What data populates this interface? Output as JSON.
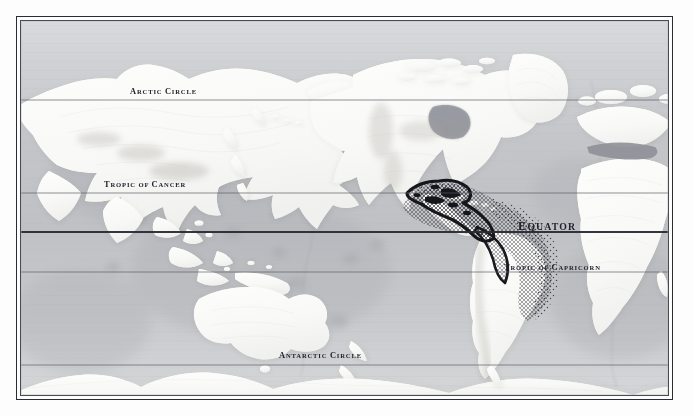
{
  "map": {
    "title_visible": false,
    "projection_center": "Pacific",
    "style": "antique shaded-relief physical world map",
    "frame_color": "#2b2b33",
    "ocean_color": "#c6c7ca",
    "land_color": "#fbfbfa",
    "shelf_color": "#8e9096",
    "range_core_color": "#16161c",
    "range_stipple_color": "#2a2a32",
    "graticule_color": "#5b5b66",
    "equator_color": "#2b2b33",
    "labels": [
      {
        "id": "arctic-circle",
        "text": "Arctic Circle",
        "size": "small",
        "latitude_y": 100
      },
      {
        "id": "tropic-cancer",
        "text": "Tropic of Cancer",
        "size": "small",
        "latitude_y": 193
      },
      {
        "id": "equator",
        "text": "Equator",
        "size": "large",
        "latitude_y": 233
      },
      {
        "id": "tropic-capricorn",
        "text": "Tropic of Capricorn",
        "size": "small",
        "latitude_y": 272
      },
      {
        "id": "antarctic-circle",
        "text": "Antarctic Circle",
        "size": "small",
        "latitude_y": 365
      }
    ],
    "distribution_range": {
      "label_visible": false,
      "core_region": "Central America, Caribbean and Gulf of Mexico",
      "stipple_region": "Eastern tropical Pacific and Pacific coast of South America"
    }
  },
  "chart_data": {
    "type": "map",
    "title": "",
    "xlabel": "",
    "ylabel": "",
    "latitude_lines": [
      {
        "name": "Arctic Circle",
        "value": 66.5,
        "hemisphere": "N",
        "weight": "thin"
      },
      {
        "name": "Tropic of Cancer",
        "value": 23.5,
        "hemisphere": "N",
        "weight": "thin"
      },
      {
        "name": "Equator",
        "value": 0,
        "hemisphere": "",
        "weight": "thick"
      },
      {
        "name": "Tropic of Capricorn",
        "value": 23.5,
        "hemisphere": "S",
        "weight": "thin"
      },
      {
        "name": "Antarctic Circle",
        "value": 66.5,
        "hemisphere": "S",
        "weight": "thin"
      }
    ]
  }
}
